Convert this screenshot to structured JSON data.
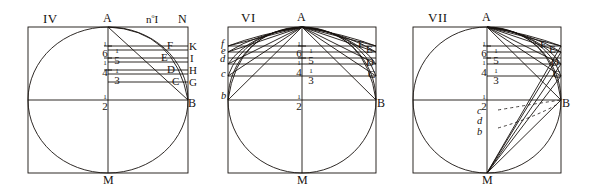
{
  "plate": {
    "description": "Engraved geometric plate with three figures showing a square with inscribed circle, chords and fractional divisions",
    "background": "#ffffff",
    "ink": "#17120f"
  },
  "figures": [
    {
      "id": "fig-IV",
      "roman": "IV",
      "number_note": "n",
      "number_note_sup": "o",
      "number_note_tail": "I",
      "corner_label": "N",
      "apex": "A",
      "bottom": "M",
      "right_mid": "B",
      "chord_ends": [
        "F",
        "E",
        "D",
        "C"
      ],
      "edge_labels": [
        "K",
        "I",
        "H",
        "G"
      ],
      "fractions": [
        {
          "n": "1",
          "d": "6"
        },
        {
          "n": "1",
          "d": "5"
        },
        {
          "n": "1",
          "d": "4"
        },
        {
          "n": "1",
          "d": "3"
        },
        {
          "n": "1",
          "d": "2"
        }
      ]
    },
    {
      "id": "fig-VI",
      "roman": "VI",
      "apex": "A",
      "bottom": "M",
      "right_mid": "B",
      "chord_ends": [
        "F",
        "E",
        "D",
        "C"
      ],
      "left_labels": [
        "f",
        "e",
        "d",
        "c",
        "b"
      ],
      "fractions": [
        {
          "n": "1",
          "d": "6"
        },
        {
          "n": "1",
          "d": "5"
        },
        {
          "n": "1",
          "d": "4"
        },
        {
          "n": "1",
          "d": "3"
        },
        {
          "n": "1",
          "d": "2"
        }
      ]
    },
    {
      "id": "fig-VII",
      "roman": "VII",
      "apex": "A",
      "bottom": "M",
      "right_mid": "B",
      "chord_ends": [
        "F",
        "E",
        "D",
        "C"
      ],
      "lower_labels": [
        "c",
        "d",
        "b"
      ],
      "fractions": [
        {
          "n": "1",
          "d": "6"
        },
        {
          "n": "1",
          "d": "5"
        },
        {
          "n": "1",
          "d": "4"
        },
        {
          "n": "1",
          "d": "3"
        },
        {
          "n": "1",
          "d": "2"
        }
      ]
    }
  ]
}
